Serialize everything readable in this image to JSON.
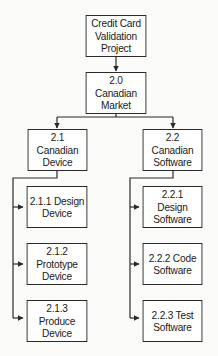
{
  "diagram": {
    "type": "work-breakdown-structure",
    "root": {
      "id": "root",
      "label": "Credit Card\nValidation\nProject"
    },
    "level1": {
      "id": "2.0",
      "label": "2.0 Canadian\nMarket"
    },
    "branches": [
      {
        "id": "2.1",
        "label": "2.1 Canadian\nDevice",
        "children": [
          {
            "id": "2.1.1",
            "label": "2.1.1 Design\nDevice"
          },
          {
            "id": "2.1.2",
            "label": "2.1.2 Prototype\nDevice"
          },
          {
            "id": "2.1.3",
            "label": "2.1.3 Produce\nDevice"
          }
        ]
      },
      {
        "id": "2.2",
        "label": "2.2 Canadian\nSoftware",
        "children": [
          {
            "id": "2.2.1",
            "label": "2.2.1 Design\nSoftware"
          },
          {
            "id": "2.2.2",
            "label": "2.2.2 Code\nSoftware"
          },
          {
            "id": "2.2.3",
            "label": "2.2.3 Test\nSoftware"
          }
        ]
      }
    ],
    "colors": {
      "line": "#2a2a2a",
      "box_fill": "#ffffff",
      "background": "#fbfbf9"
    }
  }
}
